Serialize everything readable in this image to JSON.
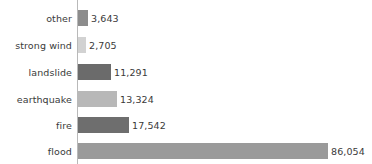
{
  "chart_data": {
    "type": "bar",
    "orientation": "horizontal",
    "title": "",
    "subtitle": "",
    "xlabel": "",
    "ylabel": "",
    "grid": false,
    "legend": "none",
    "axis_line_color": "#b9b9b9",
    "background_color": "#ffffff",
    "text_color": "#3a3a3a",
    "xlim": [
      0,
      86054
    ],
    "categories": [
      "other",
      "strong wind",
      "landslide",
      "earthquake",
      "fire",
      "flood"
    ],
    "values": [
      3643,
      2705,
      11291,
      13324,
      17542,
      86054
    ],
    "value_labels": [
      "3,643",
      "2,705",
      "11,291",
      "13,324",
      "17,542",
      "86,054"
    ],
    "bar_colors": [
      "#8c8c8c",
      "#d2d2d2",
      "#6b6b6b",
      "#b8b8b8",
      "#6e6e6e",
      "#9a9a9a"
    ],
    "bars": [
      {
        "category": "other",
        "value": 3643,
        "value_label": "3,643",
        "color": "#8c8c8c",
        "pixel_width": 10,
        "label_left": 91
      },
      {
        "category": "strong wind",
        "value": 2705,
        "value_label": "2,705",
        "color": "#d2d2d2",
        "pixel_width": 8,
        "label_left": 89
      },
      {
        "category": "landslide",
        "value": 11291,
        "value_label": "11,291",
        "color": "#6b6b6b",
        "pixel_width": 33,
        "label_left": 114
      },
      {
        "category": "earthquake",
        "value": 13324,
        "value_label": "13,324",
        "color": "#b8b8b8",
        "pixel_width": 39,
        "label_left": 120
      },
      {
        "category": "fire",
        "value": 17542,
        "value_label": "17,542",
        "color": "#6e6e6e",
        "pixel_width": 51,
        "label_left": 132
      },
      {
        "category": "flood",
        "value": 86054,
        "value_label": "86,054",
        "color": "#9a9a9a",
        "pixel_width": 250,
        "label_left": 331
      }
    ]
  }
}
